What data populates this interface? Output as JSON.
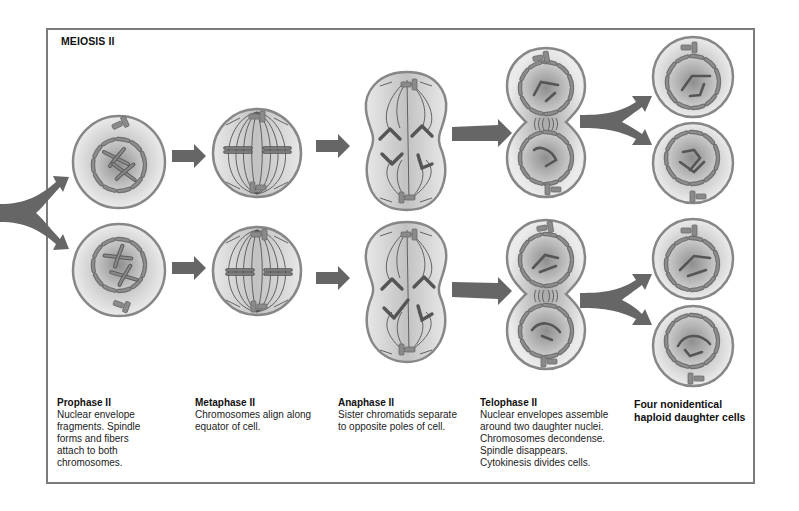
{
  "diagram": {
    "title": "MEIOSIS II",
    "colors": {
      "frame": "#7c7c7c",
      "cell_border": "#878787",
      "cell_fill_outer": "#e6e6e6",
      "cell_fill_inner": "#b9b9b9",
      "nuclear_fragment": "#7a7a7a",
      "chromosome": "#707070",
      "arrow": "#666666",
      "spindle": "#555555"
    },
    "stages": [
      {
        "id": "prophase",
        "label": "Prophase II",
        "description": "Nuclear envelope\nfragments. Spindle\nforms and fibers\nattach to both\nchromosomes."
      },
      {
        "id": "metaphase",
        "label": "Metaphase II",
        "description": "Chromosomes align along\nequator of cell."
      },
      {
        "id": "anaphase",
        "label": "Anaphase II",
        "description": "Sister chromatids separate\nto opposite poles of cell."
      },
      {
        "id": "telophase",
        "label": "Telophase II",
        "description": "Nuclear envelopes assemble\naround two daughter nuclei.\nChromosomes decondense.\nSpindle disappears.\nCytokinesis divides cells."
      },
      {
        "id": "result",
        "label": "Four nonidentical\nhaploid daughter cells",
        "description": ""
      }
    ]
  }
}
